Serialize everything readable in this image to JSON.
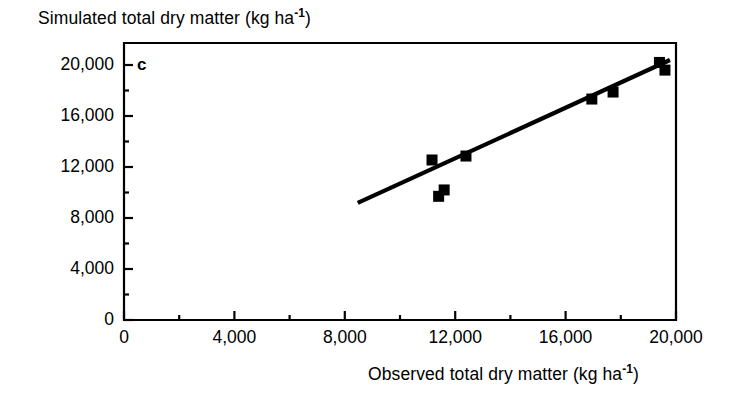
{
  "chart_data": {
    "type": "scatter",
    "title": "",
    "panel_label": "c",
    "xlabel": "Observed total dry matter (kg ha-1)",
    "xlabel_parts": {
      "text": "Observed total dry matter (kg ha",
      "sup": "-1",
      "tail": ")"
    },
    "ylabel": "Simulated total dry matter (kg ha-1)",
    "ylabel_parts": {
      "text": "Simulated total dry matter (kg ha",
      "sup": "-1",
      "tail": ")"
    },
    "xlim": [
      0,
      20000
    ],
    "ylim": [
      0,
      20000
    ],
    "xticks": [
      0,
      4000,
      8000,
      12000,
      16000,
      20000
    ],
    "yticks": [
      0,
      4000,
      8000,
      12000,
      16000,
      20000
    ],
    "xtick_labels": [
      "0",
      "4,000",
      "8,000",
      "12,000",
      "16,000",
      "20,000"
    ],
    "ytick_labels": [
      "0",
      "4,000",
      "8,000",
      "12,000",
      "16,000",
      "20,000"
    ],
    "xminor_ticks": [
      2000,
      6000,
      10000,
      14000,
      18000
    ],
    "yminor_ticks": [
      2000,
      6000,
      10000,
      14000,
      18000
    ],
    "grid": false,
    "legend": false,
    "marker": "filled-square",
    "marker_color": "#000000",
    "line_color": "#000000",
    "points": [
      {
        "x": 11400,
        "y": 9700
      },
      {
        "x": 11600,
        "y": 10200
      },
      {
        "x": 11160,
        "y": 12550
      },
      {
        "x": 12390,
        "y": 12860
      },
      {
        "x": 16950,
        "y": 17330
      },
      {
        "x": 17720,
        "y": 17880
      },
      {
        "x": 19400,
        "y": 20200
      },
      {
        "x": 19600,
        "y": 19600
      }
    ],
    "fit_line": {
      "type": "regression",
      "x_start": 8470,
      "y_start": 9180,
      "x_end": 19780,
      "y_end": 20390
    }
  },
  "axes": {
    "frame_color": "#000000",
    "tick_direction": "in"
  }
}
